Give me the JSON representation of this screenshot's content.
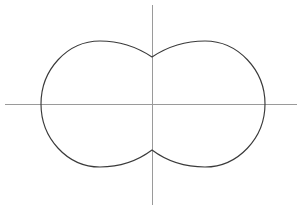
{
  "figure": {
    "name": "cassini-oval-plot",
    "width": 303,
    "height": 212,
    "background_color": "#ffffff",
    "title": "",
    "caption": ""
  },
  "colors": {
    "curve_stroke": "#3a3a3a",
    "axis_stroke": "#9a9a9a",
    "background": "#ffffff"
  },
  "axes": {
    "x_axis": {
      "label": "",
      "y_pixel": 104,
      "x_start_pixel": 5,
      "x_end_pixel": 297,
      "ticks": [],
      "tick_labels": []
    },
    "y_axis": {
      "label": "",
      "x_pixel": 152,
      "y_start_pixel": 5,
      "y_end_pixel": 205,
      "ticks": [],
      "tick_labels": []
    },
    "origin": {
      "x": 152,
      "y": 104
    },
    "grid": false,
    "legend": null
  },
  "chart_data": {
    "type": "line",
    "title": "",
    "subtitle": "",
    "xlabel": "",
    "ylabel": "",
    "grid": false,
    "legend": null,
    "curve_name": "cassini-oval-peanut",
    "xlim": [
      -1.6,
      1.6
    ],
    "ylim": [
      -0.75,
      0.75
    ],
    "scale": {
      "px_per_unit_x": 91.0,
      "px_per_unit_y": 91.0
    },
    "key_points": [
      {
        "name": "left-extremum",
        "x_units": -1.22,
        "y_units": 0.0,
        "x_px": 41,
        "y_px": 104
      },
      {
        "name": "right-extremum",
        "x_units": 1.22,
        "y_units": 0.0,
        "x_px": 265,
        "y_px": 104
      },
      {
        "name": "left-lobe-top",
        "x_units": -0.57,
        "y_units": 0.69,
        "x_px": 100,
        "y_px": 41
      },
      {
        "name": "right-lobe-top",
        "x_units": 0.58,
        "y_units": 0.69,
        "x_px": 205,
        "y_px": 41
      },
      {
        "name": "left-lobe-bottom",
        "x_units": -0.57,
        "y_units": -0.69,
        "x_px": 100,
        "y_px": 167
      },
      {
        "name": "right-lobe-bottom",
        "x_units": 0.58,
        "y_units": -0.69,
        "x_px": 205,
        "y_px": 167
      },
      {
        "name": "waist-top",
        "x_units": 0.0,
        "y_units": 0.516,
        "x_px": 152,
        "y_px": 57
      },
      {
        "name": "waist-bottom",
        "x_units": 0.0,
        "y_units": -0.505,
        "x_px": 152,
        "y_px": 150
      }
    ],
    "series": [
      {
        "name": "peanut-curve",
        "closed": true,
        "stroke": "#3a3a3a",
        "path_d": "M 41,104 C 41,70 67,41 100,41 C 124,41 140,49 152,57 C 164,49 181,41 205,41 C 238,41 265,70 265,104 C 265,138 238,167 205,167 C 181,167 164,159 152,150 C 140,159 124,167 100,167 C 67,167 41,138 41,104 Z"
      }
    ]
  },
  "elements": {
    "curve_label": "peanut curve",
    "x_axis_label": "horizontal axis",
    "y_axis_label": "vertical axis"
  }
}
